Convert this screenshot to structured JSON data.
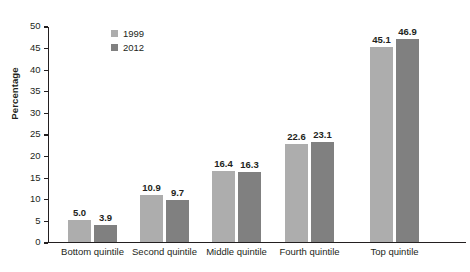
{
  "chart_data": {
    "type": "bar",
    "title": "",
    "xlabel": "",
    "ylabel": "Percentage",
    "ylim": [
      0,
      50
    ],
    "yticks": [
      0,
      5,
      10,
      15,
      20,
      25,
      30,
      35,
      40,
      45,
      50
    ],
    "grid": false,
    "legend_position": "top-left",
    "categories": [
      "Bottom quintile",
      "Second quintile",
      "Middle quintile",
      "Fourth quintile",
      "Top quintile"
    ],
    "series": [
      {
        "name": "1999",
        "color": "#adadad",
        "values": [
          5.0,
          10.9,
          16.4,
          22.6,
          45.1
        ],
        "labels": [
          "5.0",
          "10.9",
          "16.4",
          "22.6",
          "45.1"
        ]
      },
      {
        "name": "2012",
        "color": "#808080",
        "values": [
          3.9,
          9.7,
          16.3,
          23.1,
          46.9
        ],
        "labels": [
          "3.9",
          "9.7",
          "16.3",
          "23.1",
          "46.9"
        ]
      }
    ]
  },
  "axis": {
    "y_title": "Percentage",
    "tick_labels": [
      "50",
      "45",
      "40",
      "35",
      "30",
      "25",
      "20",
      "15",
      "10",
      "5",
      "0"
    ]
  },
  "colors": {
    "series_1999": "#adadad",
    "series_2012": "#808080",
    "axis": "#231f20",
    "text": "#231f20",
    "background": "#ffffff"
  }
}
